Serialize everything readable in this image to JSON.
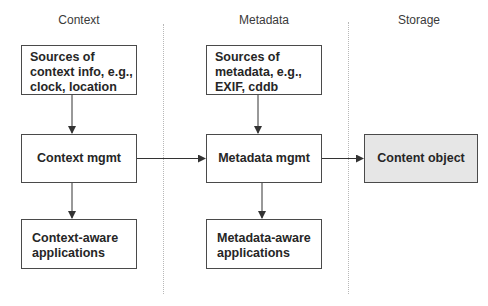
{
  "columns": [
    {
      "header": "Context"
    },
    {
      "header": "Metadata"
    },
    {
      "header": "Storage"
    }
  ],
  "boxes": {
    "context_sources": {
      "lines": [
        "Sources of",
        "context info, e.g.,",
        "clock, location"
      ]
    },
    "context_mgmt": {
      "label": "Context mgmt"
    },
    "context_apps": {
      "lines": [
        "Context-aware",
        "applications"
      ]
    },
    "metadata_sources": {
      "lines": [
        "Sources of",
        "metadata, e.g.,",
        "EXIF, cddb"
      ]
    },
    "metadata_mgmt": {
      "label": "Metadata mgmt"
    },
    "metadata_apps": {
      "lines": [
        "Metadata-aware",
        "applications"
      ]
    },
    "content_object": {
      "label": "Content object",
      "fill": "#e6e6e6"
    }
  },
  "edges": [
    {
      "from": "Sources of context info",
      "to": "Context mgmt"
    },
    {
      "from": "Context mgmt",
      "to": "Context-aware applications"
    },
    {
      "from": "Context mgmt",
      "to": "Metadata mgmt"
    },
    {
      "from": "Sources of metadata",
      "to": "Metadata mgmt"
    },
    {
      "from": "Metadata mgmt",
      "to": "Metadata-aware applications"
    },
    {
      "from": "Metadata mgmt",
      "to": "Content object"
    }
  ],
  "colors": {
    "border": "#4a4a4a",
    "divider": "#b8b8b8",
    "highlight_fill": "#e6e6e6"
  }
}
